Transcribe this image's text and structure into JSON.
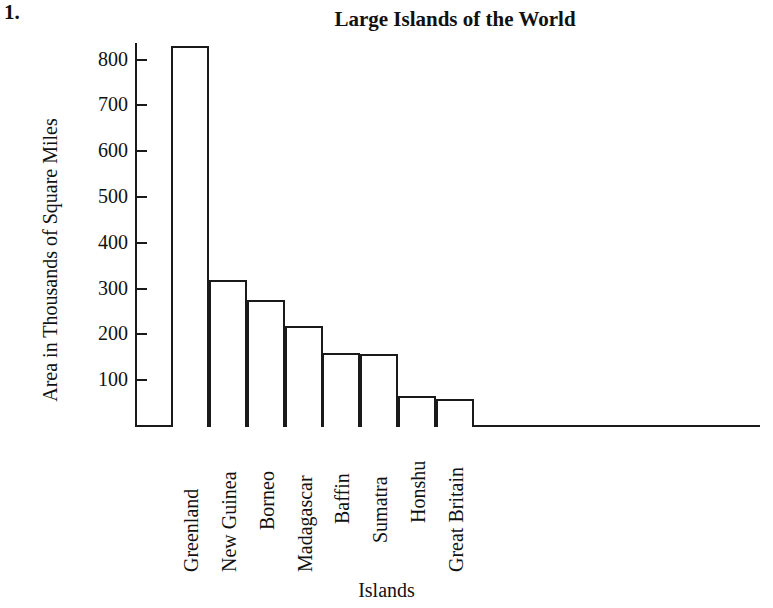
{
  "problem_number": "1.",
  "chart_data": {
    "type": "bar",
    "title": "Large Islands of the World",
    "xlabel": "Islands",
    "ylabel": "Area in Thousands of Square Miles",
    "categories": [
      "Greenland",
      "New Guinea",
      "Borneo",
      "Madagascar",
      "Baffin",
      "Sumatra",
      "Honshu",
      "Great Britain"
    ],
    "values": [
      830,
      318,
      275,
      218,
      160,
      157,
      65,
      58
    ],
    "ylim": [
      0,
      860
    ],
    "yticks": [
      100,
      200,
      300,
      400,
      500,
      600,
      700,
      800
    ],
    "ytick_labels": [
      "100",
      "200",
      "300",
      "400",
      "500",
      "600",
      "700",
      "800"
    ],
    "grid": false,
    "legend": "none",
    "bar_fill_color": "#ffffff",
    "bar_edge_color": "#1a1a1a",
    "axis_color": "#1a1a1a",
    "background_color": "#ffffff"
  }
}
